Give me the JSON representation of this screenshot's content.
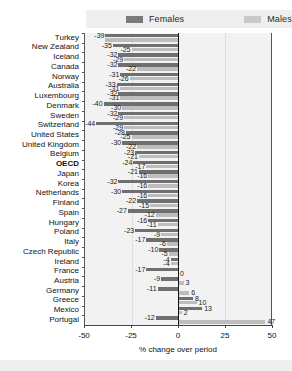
{
  "legend": {
    "females_label": "Females",
    "males_label": "Males",
    "females_color": "#6f6f6f",
    "males_color": "#bdbdbd"
  },
  "axis": {
    "xlabel": "% change over period",
    "ticks": [
      "-50",
      "-25",
      "0",
      "25",
      "50"
    ],
    "xmin": -50,
    "xmax": 50
  },
  "chart_data": {
    "type": "bar",
    "orientation": "horizontal",
    "title": "",
    "xlabel": "% change over period",
    "ylabel": "",
    "xlim": [
      -50,
      50
    ],
    "grid": false,
    "legend_position": "top",
    "categories": [
      "Turkey",
      "New Zealand",
      "Iceland",
      "Canada",
      "Norway",
      "Australia",
      "Luxembourg",
      "Denmark",
      "Sweden",
      "Switzerland",
      "United States",
      "United Kingdom",
      "Belgium",
      "OECD",
      "Japan",
      "Korea",
      "Netherlands",
      "Finland",
      "Spain",
      "Hungary",
      "Poland",
      "Italy",
      "Czech Republic",
      "Ireland",
      "France",
      "Austria",
      "Germany",
      "Greece",
      "Mexico",
      "Portugal"
    ],
    "series": [
      {
        "name": "Females",
        "color": "#6f6f6f",
        "values": [
          -39,
          -35,
          -32,
          -32,
          -31,
          -33,
          -32,
          -40,
          -32,
          -44,
          -28,
          -30,
          -23,
          -24,
          -21,
          -32,
          -30,
          -22,
          -27,
          -16,
          -23,
          -17,
          -10,
          -4,
          -17,
          -9,
          -11,
          8,
          13,
          -12
        ]
      },
      {
        "name": "Males",
        "color": "#bdbdbd",
        "values": [
          -39,
          -25,
          -29,
          -22,
          -26,
          -31,
          -31,
          -30,
          -29,
          -29,
          -25,
          -22,
          -21,
          -17,
          -16,
          -16,
          -16,
          -15,
          -12,
          -11,
          -9,
          -6,
          -5,
          -4,
          0,
          3,
          6,
          10,
          2,
          47
        ]
      }
    ],
    "annotations": {
      "turkey_bar_note": "Turkey female bar extends to -39 with no separate visible male label"
    }
  },
  "labels": {
    "females_values": [
      "-39",
      "-35",
      "-32",
      "-32",
      "-31",
      "-33",
      "-32",
      "-40",
      "-32",
      "-44",
      "-28",
      "-30",
      "-23",
      "-24",
      "-21",
      "-32",
      "-30",
      "-22",
      "-27",
      "-16",
      "-23",
      "-17",
      "-10",
      "-4",
      "-17",
      "-9",
      "-11",
      "8",
      "13",
      "-12"
    ],
    "males_values": [
      "",
      "-25",
      "-29",
      "-22",
      "-26",
      "-31",
      "-31",
      "-30",
      "-29",
      "-29",
      "-25",
      "-22",
      "-21",
      "-17",
      "-16",
      "-16",
      "-16",
      "-15",
      "-12",
      "-11",
      "-9",
      "-6",
      "-5",
      "-4",
      "0",
      "3",
      "6",
      "10",
      "2",
      "47"
    ]
  }
}
